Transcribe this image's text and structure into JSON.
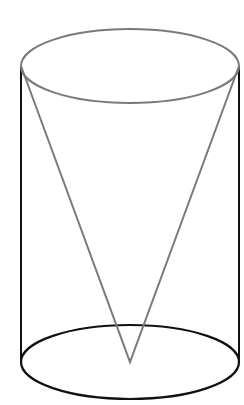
{
  "figure": {
    "width": 244,
    "height": 405,
    "background": "#ffffff",
    "colors": {
      "top_outline": "#7a7a7a",
      "cone_outline": "#7a7a7a",
      "cylinder_sides": "#111111",
      "bottom_outline": "#111111"
    },
    "cylinder": {
      "center_x": 130,
      "radius_x": 109,
      "radius_y": 37,
      "top_y": 66,
      "bottom_y": 362
    },
    "cone": {
      "base_y": 66,
      "apex": {
        "x": 130,
        "y": 362
      }
    }
  }
}
